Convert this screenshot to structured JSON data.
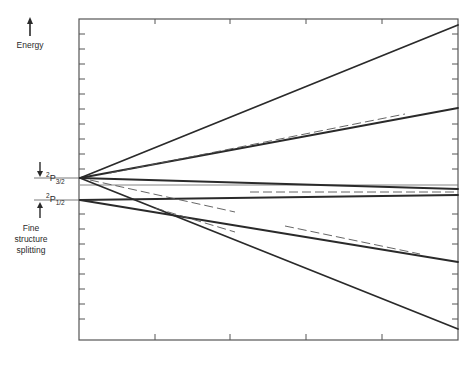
{
  "header_fragment": "Atomic fine structure",
  "axis": {
    "energy_label": "Energy",
    "fine_structure_label": "Fine structure splitting"
  },
  "levels": {
    "upper": {
      "term": "2P",
      "superscript": "2",
      "letter": "P",
      "subscript": "3/2"
    },
    "lower": {
      "term": "2P",
      "superscript": "2",
      "letter": "P",
      "subscript": "1/2"
    }
  },
  "colors": {
    "line": "#2a2a2a",
    "dashed": "#555555",
    "frame": "#555555",
    "background": "#ffffff"
  },
  "frame": {
    "x0": 79,
    "y0": 19,
    "x1": 458,
    "y1": 340
  },
  "lines": {
    "solid": [
      {
        "from": "P3/2",
        "x1": 80,
        "y1": 178,
        "x2": 458,
        "y2": 25
      },
      {
        "from": "P3/2",
        "x1": 80,
        "y1": 178,
        "x2": 458,
        "y2": 108
      },
      {
        "from": "P3/2",
        "x1": 80,
        "y1": 178,
        "x2": 458,
        "y2": 189
      },
      {
        "from": "P3/2",
        "x1": 80,
        "y1": 178,
        "x2": 458,
        "y2": 329
      },
      {
        "from": "P1/2",
        "x1": 80,
        "y1": 200,
        "x2": 458,
        "y2": 195
      },
      {
        "from": "P1/2",
        "x1": 80,
        "y1": 200,
        "x2": 458,
        "y2": 262
      }
    ],
    "dashed": [
      {
        "x1": 110,
        "y1": 173,
        "x2": 405,
        "y2": 114
      },
      {
        "x1": 90,
        "y1": 180,
        "x2": 235,
        "y2": 212
      },
      {
        "x1": 150,
        "y1": 205,
        "x2": 233,
        "y2": 213
      },
      {
        "x1": 155,
        "y1": 208,
        "x2": 235,
        "y2": 232
      },
      {
        "x1": 285,
        "y1": 226,
        "x2": 420,
        "y2": 254
      },
      {
        "x1": 250,
        "y1": 192,
        "x2": 458,
        "y2": 192
      }
    ],
    "thin": [
      {
        "x1": 80,
        "y1": 185,
        "x2": 458,
        "y2": 185
      }
    ]
  }
}
